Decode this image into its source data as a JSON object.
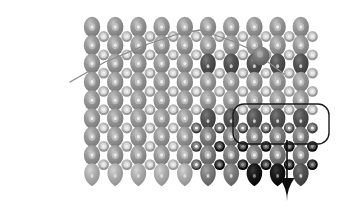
{
  "figure": {
    "background_color": "#ffffff",
    "width": 340,
    "height": 208
  },
  "chart_data": {
    "type": "scatter",
    "xlabel": "",
    "ylabel": "",
    "xlim": [
      0,
      340
    ],
    "ylim": [
      0,
      208
    ],
    "grid": false,
    "legend": "none"
  },
  "colors": {
    "atom_light": "#a8a8a8",
    "atom_mid": "#8d8d8d",
    "atom_dark": "#6f6f6f",
    "atom_darker": "#4a4a4a",
    "atom_black": "#111111",
    "ring_light": "#b4b4b4",
    "ring_core": "#d6d6d6",
    "outline": "#1a1a1a",
    "tip_line": "#8a8a8a",
    "tip_atom": "#7d7d7d",
    "arrow": "#0d0d0d",
    "background": "#ffffff"
  },
  "tip": {
    "label": "scanning-probe-cantilever",
    "apex_atom_label": "tip-apex-atom",
    "path_points": "70,82 105,62 148,44 178,34 200,30",
    "apex_atom": {
      "cx": 261,
      "cy": 56,
      "rx": 8.5,
      "ry": 9.5
    },
    "neck_line": "268,62 284,74",
    "line_width": 1.3
  },
  "lattice": {
    "label": "atomic-lattice",
    "origin_x": 92,
    "origin_y": 27,
    "col_spacing": 23.2,
    "row_spacing": 18.3,
    "columns": 10,
    "rows": 9,
    "big_atom": {
      "rx": 8.2,
      "ry": 10.2
    },
    "small_ring": {
      "r_outer": 5.4,
      "r_mid": 3.2,
      "r_inner": 1.6
    }
  },
  "selection": {
    "label": "selected-cluster-outline",
    "shape": "rounded-rectangle",
    "x": 233,
    "y": 104,
    "width": 96,
    "height": 40,
    "corner_radius": 11,
    "stroke_width": 1.4,
    "stroke_color": "#1a1a1a"
  },
  "arrow": {
    "label": "pull-direction-arrow",
    "shaft_x": 287,
    "shaft_y1": 140,
    "shaft_y2": 178,
    "head_width": 15,
    "head_length": 23,
    "tip_y": 201,
    "color": "#0d0d0d",
    "direction": "down"
  },
  "dark_rows": {
    "row_indices": [
      2,
      5
    ],
    "start_col": 5,
    "end_col": 9
  }
}
